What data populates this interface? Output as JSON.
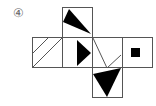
{
  "figure": {
    "label": "④",
    "stroke_color": "#555555",
    "fill_color": "#000000",
    "faces": [
      {
        "id": "top",
        "pattern": "black triangle"
      },
      {
        "id": "left",
        "pattern": "two diagonal lines"
      },
      {
        "id": "center",
        "pattern": "black right-pointing triangle"
      },
      {
        "id": "right1",
        "pattern": "V-shaped lines"
      },
      {
        "id": "right2",
        "pattern": "small black square"
      },
      {
        "id": "bottom",
        "pattern": "black downward triangle"
      }
    ]
  }
}
